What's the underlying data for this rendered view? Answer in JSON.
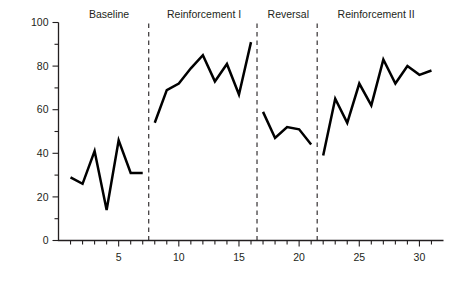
{
  "figure": {
    "title": "",
    "y_axis_title": "Percentage of Study Behavior",
    "x_axis_title": "Sessions"
  },
  "chart_data": {
    "type": "line",
    "title": "",
    "xlabel": "Sessions",
    "ylabel": "Percentage of Study Behavior",
    "xlim": [
      0,
      32
    ],
    "ylim": [
      0,
      100
    ],
    "grid": false,
    "legend": null,
    "x_ticks_major": [
      5,
      10,
      15,
      20,
      25,
      30
    ],
    "x_tick_labels": [
      "5",
      "10",
      "15",
      "20",
      "25",
      "30"
    ],
    "x_ticks_minor": [
      1,
      2,
      3,
      4,
      6,
      7,
      8,
      9,
      11,
      12,
      13,
      14,
      16,
      17,
      18,
      19,
      21,
      22,
      23,
      24,
      26,
      27,
      28,
      29,
      31
    ],
    "y_ticks_major": [
      0,
      20,
      40,
      60,
      80,
      100
    ],
    "y_tick_labels": [
      "0",
      "20",
      "40",
      "60",
      "80",
      "100"
    ],
    "y_ticks_minor": [
      10,
      30,
      50,
      70,
      90
    ],
    "x": [
      1,
      2,
      3,
      4,
      5,
      6,
      7,
      8,
      9,
      10,
      11,
      12,
      13,
      14,
      15,
      16,
      17,
      18,
      19,
      20,
      21,
      22,
      23,
      24,
      25,
      26,
      27,
      28,
      29,
      30,
      31
    ],
    "series": [
      {
        "name": "Percentage of study behavior",
        "values": [
          29,
          26,
          41,
          14,
          46,
          31,
          31,
          54,
          69,
          72,
          79,
          85,
          73,
          81,
          67,
          91,
          59,
          47,
          52,
          51,
          44,
          39,
          65,
          54,
          72,
          62,
          83,
          72,
          80,
          76,
          78
        ]
      }
    ],
    "phases": [
      {
        "name": "Baseline",
        "start": 1,
        "end": 7,
        "label_x": 4.2
      },
      {
        "name": "Reinforcement I",
        "start": 8,
        "end": 16,
        "label_x": 12.1
      },
      {
        "name": "Reversal",
        "start": 17,
        "end": 21,
        "label_x": 19.1
      },
      {
        "name": "Reinforcement II",
        "start": 22,
        "end": 31,
        "label_x": 26.4
      }
    ],
    "phase_dividers": [
      7.5,
      16.5,
      21.5
    ],
    "annotations": []
  },
  "style": {
    "line_color": "#000000",
    "axis_color": "#231f20",
    "text_color": "#231f20",
    "background": "#ffffff"
  }
}
